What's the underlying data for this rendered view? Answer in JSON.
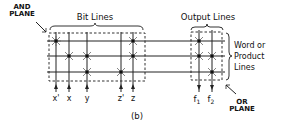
{
  "diagram": {
    "caption": "(b)",
    "labels": {
      "and_plane_line1": "AND",
      "and_plane_line2": "PLANE",
      "bit_lines": "Bit Lines",
      "output_lines": "Output Lines",
      "word_line1": "Word or",
      "word_line2": "Product",
      "word_line3": "Lines",
      "or_plane_line1": "OR",
      "or_plane_line2": "PLANE"
    },
    "inputs": [
      {
        "label": "x'",
        "x": 56
      },
      {
        "label": "x",
        "x": 69
      },
      {
        "label": "y",
        "x": 87
      },
      {
        "label": "z'",
        "x": 121
      },
      {
        "label": "z",
        "x": 133
      }
    ],
    "outputs": [
      {
        "label": "f",
        "sub": "1",
        "x": 199
      },
      {
        "label": "f",
        "sub": "2",
        "x": 212
      }
    ],
    "product_lines_y": [
      41,
      56,
      72
    ],
    "and_plane_connections": [
      {
        "row": 0,
        "input": 0
      },
      {
        "row": 0,
        "input": 4
      },
      {
        "row": 1,
        "input": 1
      },
      {
        "row": 1,
        "input": 2
      },
      {
        "row": 1,
        "input": 4
      },
      {
        "row": 2,
        "input": 2
      },
      {
        "row": 2,
        "input": 3
      }
    ],
    "or_plane_connections": [
      {
        "row": 0,
        "output": 0
      },
      {
        "row": 1,
        "output": 0
      },
      {
        "row": 1,
        "output": 1
      },
      {
        "row": 2,
        "output": 1
      }
    ]
  }
}
